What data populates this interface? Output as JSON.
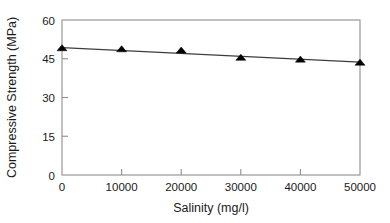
{
  "chart_data": {
    "type": "scatter",
    "title": "",
    "xlabel": "Salinity (mg/l)",
    "ylabel": "Compressive Strength (MPa)",
    "xlim": [
      0,
      50000
    ],
    "ylim": [
      0,
      60
    ],
    "xticks": [
      0,
      10000,
      20000,
      30000,
      40000,
      50000
    ],
    "yticks": [
      0,
      15,
      30,
      45,
      60
    ],
    "xtick_labels": [
      "0",
      "10000",
      "20000",
      "30000",
      "40000",
      "50000"
    ],
    "ytick_labels": [
      "0",
      "15",
      "30",
      "45",
      "60"
    ],
    "grid": false,
    "legend": null,
    "marker_style": "filled-triangle",
    "marker_color": "#000000",
    "line_color": "#3d3d3d",
    "frame_color": "#8f8f8f",
    "background_color": "#ffffff",
    "x": [
      0,
      10000,
      20000,
      30000,
      40000,
      50000
    ],
    "series": [
      {
        "name": "Compressive Strength",
        "values": [
          49.2,
          48.8,
          48.3,
          45.5,
          44.8,
          43.6
        ]
      }
    ],
    "trend_line": {
      "type": "linear-fit",
      "start": {
        "x": 0,
        "y": 49.3
      },
      "end": {
        "x": 50000,
        "y": 43.7
      }
    }
  }
}
